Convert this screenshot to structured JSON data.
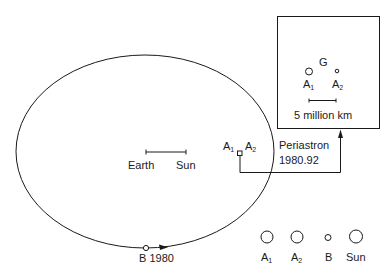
{
  "diagram": {
    "orbit": {
      "cx": 145,
      "cy": 151.5,
      "rx": 129,
      "ry": 96.5
    },
    "scale_bar": {
      "left_label": "Earth",
      "right_label": "Sun"
    },
    "binary_pair": {
      "label_1": "A",
      "label_1_sub": "1",
      "label_2": "A",
      "label_2_sub": "2"
    },
    "periastron": {
      "label": "Periastron",
      "epoch": "1980.92"
    },
    "companion": {
      "label": "B 1980"
    },
    "inset": {
      "center_label": "G",
      "star_1": "A",
      "star_1_sub": "1",
      "star_2": "A",
      "star_2_sub": "2",
      "scale_label": "5 million km"
    },
    "legend": {
      "items": [
        {
          "label": "A",
          "sub": "1",
          "size": "large"
        },
        {
          "label": "A",
          "sub": "2",
          "size": "large"
        },
        {
          "label": "B",
          "sub": "",
          "size": "small"
        },
        {
          "label": "Sun",
          "sub": "",
          "size": "large"
        }
      ]
    },
    "colors": {
      "ink": "#1a1a1a",
      "background": "#ffffff"
    }
  }
}
